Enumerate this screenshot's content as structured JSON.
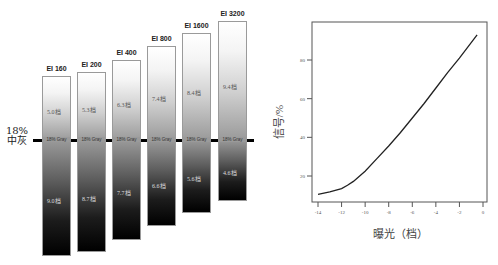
{
  "left_panel": {
    "reference_label_line1": "18%",
    "reference_label_line2": "中灰",
    "gray_label": "18% Gray",
    "bars": [
      {
        "ei": "EI 160",
        "over": "5.0档",
        "under": "9.0档",
        "x": 42,
        "top": 76,
        "bottom": 256
      },
      {
        "ei": "EI 200",
        "over": "5.3档",
        "under": "8.7档",
        "x": 77,
        "top": 72,
        "bottom": 252
      },
      {
        "ei": "EI 400",
        "over": "6.3档",
        "under": "7.7档",
        "x": 112,
        "top": 60,
        "bottom": 240
      },
      {
        "ei": "EI 800",
        "over": "7.4档",
        "under": "6.6档",
        "x": 147,
        "top": 46,
        "bottom": 226
      },
      {
        "ei": "EI 1600",
        "over": "8.4档",
        "under": "5.6档",
        "x": 182,
        "top": 33,
        "bottom": 213
      },
      {
        "ei": "EI 3200",
        "over": "9.4档",
        "under": "4.6档",
        "x": 218,
        "top": 21,
        "bottom": 201
      }
    ]
  },
  "chart_data": [
    {
      "type": "bar",
      "title": "",
      "description": "Dynamic range split around 18% middle gray for each Exposure Index",
      "categories": [
        "EI 160",
        "EI 200",
        "EI 400",
        "EI 800",
        "EI 1600",
        "EI 3200"
      ],
      "series": [
        {
          "name": "stops above 18% gray",
          "values": [
            5.0,
            5.3,
            6.3,
            7.4,
            8.4,
            9.4
          ]
        },
        {
          "name": "stops below 18% gray",
          "values": [
            9.0,
            8.7,
            7.7,
            6.6,
            5.6,
            4.6
          ]
        }
      ],
      "reference_line": "18% 中灰",
      "unit": "档"
    },
    {
      "type": "line",
      "title": "",
      "xlabel": "曝光（档）",
      "ylabel": "信号/%",
      "xlim": [
        -14.5,
        0.3
      ],
      "ylim": [
        7,
        99
      ],
      "xticks": [
        -14,
        -12,
        -10,
        -8,
        -6,
        -4,
        -2,
        0
      ],
      "yticks": [
        20,
        40,
        60,
        80
      ],
      "grid": false,
      "series": [
        {
          "name": "signal",
          "x": [
            -14,
            -13,
            -12,
            -11.5,
            -11,
            -10,
            -9,
            -8,
            -7,
            -6,
            -5,
            -4,
            -3,
            -2,
            -1,
            -0.5
          ],
          "y": [
            10.5,
            11.8,
            13.5,
            15.2,
            17.2,
            22.5,
            29,
            35.5,
            42.5,
            50,
            57.5,
            65.5,
            73.5,
            81,
            89,
            93
          ]
        }
      ]
    }
  ],
  "chart": {
    "ylabel": "信号/%",
    "xlabel": "曝光（档）",
    "xticks": [
      "-14",
      "-12",
      "-10",
      "-8",
      "-6",
      "-4",
      "-2",
      "0"
    ],
    "yticks": [
      "20",
      "40",
      "60",
      "80"
    ]
  }
}
